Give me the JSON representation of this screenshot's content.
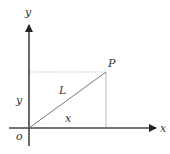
{
  "diagram": {
    "type": "coordinate-axes",
    "labels": {
      "y_axis": "y",
      "x_axis": "x",
      "origin": "o",
      "point": "P",
      "segment": "L",
      "y_component": "y",
      "x_component": "x"
    },
    "colors": {
      "axis": "#222222",
      "segment": "#7a7a7a",
      "dotted": "#999999",
      "text": "#333333"
    }
  }
}
